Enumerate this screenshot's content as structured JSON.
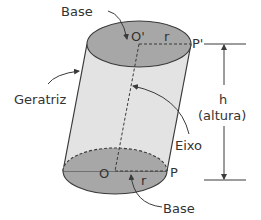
{
  "diagram": {
    "labels": {
      "base_top": "Base",
      "base_bottom": "Base",
      "generatrix": "Geratriz",
      "axis": "Eixo",
      "height": "h",
      "height_desc": "(altura)",
      "center_top": "O'",
      "center_bottom": "O",
      "radius_top": "r",
      "radius_bottom": "r",
      "point_top": "P'",
      "point_bottom": "P"
    },
    "colors": {
      "base_fill": "#a7a7a7",
      "lateral_fill": "#e3e3e3",
      "stroke": "#3a3a3a",
      "text": "#333333"
    }
  }
}
